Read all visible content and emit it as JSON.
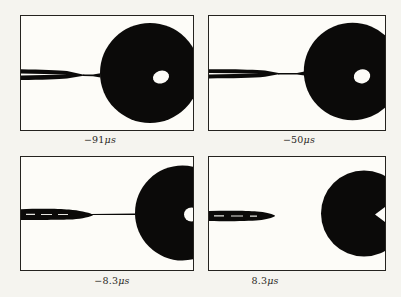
{
  "figure": {
    "colors": {
      "paper": "#f5f4ef",
      "panel_bg": "#fdfcf8",
      "ink": "#0b0a09",
      "frame": "#25231f"
    },
    "panels": [
      {
        "name": "frame-minus-91us",
        "label": {
          "value": "−91",
          "unit": "μs"
        },
        "geometry": {
          "viewbox": "0 0 172 114",
          "shapes": [
            {
              "type": "circle",
              "name": "drop",
              "cx": 129,
              "cy": 57,
              "r": 50,
              "fill": "ink"
            },
            {
              "type": "path",
              "name": "needle",
              "d": "M0,53.3 C20,53.6 38,54.3 46,55.1 L64,58.9 Q65.5,59.2 64,59.6 L46,62.5 C38,63.3 20,63.8 0,64 Z",
              "fill": "ink"
            },
            {
              "type": "path",
              "name": "liquid-bridge",
              "d": "M62,58.5 L72,58.6 L79.5,57.2 L79.5,61.4 L72,60.3 L62,60.1 Z",
              "fill": "ink"
            },
            {
              "type": "path",
              "name": "needle-bore-slit",
              "d": "M0,57.6 L46,58.4 L0,59.6 Z",
              "fill": "panel_bg"
            },
            {
              "type": "ellipse",
              "name": "drop-highlight",
              "cx": 140,
              "cy": 61,
              "rx": 8.2,
              "ry": 6.4,
              "rotate": -18,
              "fill": "panel_bg"
            }
          ]
        }
      },
      {
        "name": "frame-minus-50us",
        "label": {
          "value": "−50",
          "unit": "μs"
        },
        "geometry": {
          "viewbox": "0 0 176 114",
          "shapes": [
            {
              "type": "circle",
              "name": "drop",
              "cx": 143.5,
              "cy": 55.5,
              "r": 48.7,
              "fill": "ink"
            },
            {
              "type": "path",
              "name": "needle",
              "d": "M0,53.3 C22,52.9 45,53.5 56,54.6 L71,57.2 Q72.3,57.7 71,58.1 L56,60.8 C45,61.9 22,62.4 0,62.4 Z",
              "fill": "ink"
            },
            {
              "type": "path",
              "name": "liquid-bridge",
              "d": "M69,57.1 L88,57 L95.5,55.6 L95.5,59.6 L88,58.5 L69,58.5 Z",
              "fill": "ink"
            },
            {
              "type": "path",
              "name": "needle-bore-slit",
              "d": "M0,57 L50,57.6 L0,58.4 Z",
              "fill": "panel_bg"
            },
            {
              "type": "ellipse",
              "name": "drop-highlight",
              "cx": 153,
              "cy": 60.3,
              "rx": 8.3,
              "ry": 7,
              "rotate": -12,
              "fill": "panel_bg"
            }
          ]
        }
      },
      {
        "name": "frame-minus-8-3us",
        "label": {
          "value": "−8.3",
          "unit": "μs"
        },
        "geometry": {
          "viewbox": "0 0 172 113",
          "shapes": [
            {
              "type": "circle",
              "name": "drop",
              "cx": 161.5,
              "cy": 56,
              "r": 47.5,
              "fill": "ink"
            },
            {
              "type": "path",
              "name": "needle",
              "d": "M0,52.2 C18,51.5 38,51.7 48,52.6 C58,53.5 67,55.4 71.5,57.4 Q72.5,57.9 71.5,58.4 C67,60.4 58,62 48,62.6 C38,63.1 18,63 0,62.9 Z",
              "fill": "ink"
            },
            {
              "type": "path",
              "name": "liquid-thread",
              "d": "M70,56.9 L114.5,56.4 L114.5,58 L70,58.1 Z",
              "fill": "ink"
            },
            {
              "type": "path",
              "name": "needle-glints",
              "d": "M5,56.8 h9 v1.2 h-9 Z M20,56.9 h11 v1.1 h-11 Z M37,57 h10 v1.1 h-10 Z",
              "fill": "panel_bg",
              "opacity": 0.9
            },
            {
              "type": "ellipse",
              "name": "drop-highlight",
              "cx": 170.5,
              "cy": 57.5,
              "rx": 7.5,
              "ry": 7,
              "fill": "panel_bg"
            }
          ]
        }
      },
      {
        "name": "frame-plus-8-3us",
        "label": {
          "value": "8.3",
          "unit": "μs"
        },
        "geometry": {
          "viewbox": "0 0 176 113",
          "shapes": [
            {
              "type": "circle",
              "name": "drop",
              "cx": 155,
              "cy": 56.5,
              "r": 43,
              "fill": "ink"
            },
            {
              "type": "path",
              "name": "drop-highlight-notch",
              "d": "M176,50 L166,57.5 L176,65 Z",
              "fill": "panel_bg"
            },
            {
              "type": "path",
              "name": "detached-jet",
              "d": "M0,54 C18,53.5 38,53.6 48,54.4 C56,55 62,56.3 65.5,58.2 Q66.5,58.8 65.5,59.4 C61,61.5 55,62.8 47,63.4 C36,64.1 16,64.2 0,64.1 Z",
              "fill": "ink"
            },
            {
              "type": "path",
              "name": "jet-glints",
              "d": "M5,58.3 h10 v1.2 h-10 Z M22,58.4 h12 v1.1 h-12 Z M41,58.5 h7 v1.2 h-7 Z",
              "fill": "panel_bg",
              "opacity": 0.9
            }
          ]
        }
      }
    ]
  }
}
